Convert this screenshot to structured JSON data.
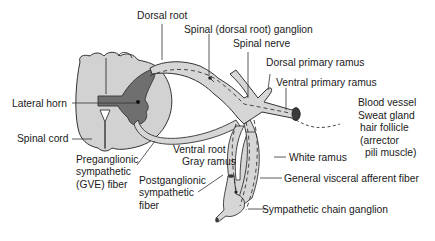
{
  "diagram": {
    "type": "anatomical-illustration",
    "colors": {
      "white_matter": "#d2d2d2",
      "gray_matter": "#6f6f6f",
      "nerve_fill": "#d6d6d6",
      "outline": "#333333",
      "vessel_end": "#3a3a3a",
      "background": "#ffffff"
    },
    "labels": {
      "dorsal_root": "Dorsal root",
      "spinal_ganglion": "Spinal (dorsal root) ganglion",
      "spinal_nerve": "Spinal nerve",
      "dorsal_primary_ramus": "Dorsal primary ramus",
      "ventral_primary_ramus": "Ventral primary ramus",
      "target_line1": "Blood vessel",
      "target_line2": "Sweat gland",
      "target_line3": "hair follicle",
      "target_line4": "(arrector",
      "target_line5": "pili muscle)",
      "lateral_horn": "Lateral horn",
      "spinal_cord": "Spinal cord",
      "ventral_root": "Ventral root",
      "gray_ramus": "Gray ramus",
      "white_ramus": "White ramus",
      "gva_fiber": "General visceral afferent fiber",
      "pregang_line1": "Preganglionic",
      "pregang_line2": "sympathetic",
      "pregang_line3": "(GVE) fiber",
      "postgang_line1": "Postganglionic",
      "postgang_line2": "sympathetic",
      "postgang_line3": "fiber",
      "chain_ganglion": "Sympathetic chain ganglion"
    }
  }
}
